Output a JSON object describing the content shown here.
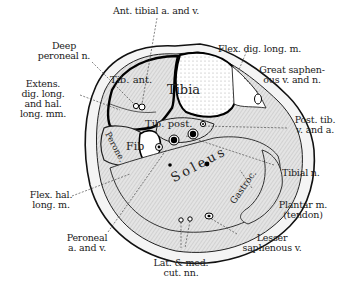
{
  "figure": {
    "type": "anatomical cross-section of lower leg",
    "colors": {
      "ink": "#111111",
      "background": "#ffffff",
      "muscle_fill": "#d8d8d8",
      "skin_fill": "#f2f2f2",
      "bone_fill": "#ffffff"
    }
  },
  "external_labels": {
    "ant_tibial": "Ant. tibial a. and v.",
    "deep_peroneal_1": "Deep",
    "deep_peroneal_2": "peroneal n.",
    "extens_1": "Extens.",
    "extens_2": "dig. long.",
    "extens_3": "and hal.",
    "extens_4": "long. mm.",
    "flex_dig": "Flex. dig. long. m.",
    "great_saph_1": "Great saphen-",
    "great_saph_2": "ous v. and n.",
    "post_tib_1": "Post. tib.",
    "post_tib_2": "v. and a.",
    "tibial_n": "Tibial n.",
    "flex_hal_1": "Flex. hal.",
    "flex_hal_2": "long. m.",
    "plantar_1": "Plantar m.",
    "plantar_2": "(tendon)",
    "peroneal_av_1": "Peroneal",
    "peroneal_av_2": "a. and v.",
    "lesser_saph_1": "Lesser",
    "lesser_saph_2": "saphenous v.",
    "lat_med_1": "Lat. & med.",
    "lat_med_2": "cut. nn."
  },
  "internal_labels": {
    "tib_ant": "Tib. ant.",
    "tibia": "Tibia",
    "tib_post": "Tib. post.",
    "peroneus": "Perone.",
    "fib": "Fib",
    "soleus": "Soleus",
    "gastroc": "Gastroc."
  }
}
